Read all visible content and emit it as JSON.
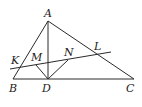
{
  "diagram": {
    "type": "geometry",
    "points": {
      "A": {
        "label": "A",
        "x": 48,
        "y": 21
      },
      "B": {
        "label": "B",
        "x": 13,
        "y": 79
      },
      "C": {
        "label": "C",
        "x": 134,
        "y": 79
      },
      "D": {
        "label": "D",
        "x": 48,
        "y": 79
      },
      "K": {
        "label": "K",
        "x": 19,
        "y": 67
      },
      "L": {
        "label": "L",
        "x": 97,
        "y": 54
      },
      "M": {
        "label": "M",
        "x": 36,
        "y": 65
      },
      "N": {
        "label": "N",
        "x": 68,
        "y": 60
      }
    },
    "segments": [
      "AB",
      "AC",
      "BC",
      "AD",
      "MD",
      "ND",
      "KL-line"
    ],
    "line_color": "#2a2a2a"
  }
}
